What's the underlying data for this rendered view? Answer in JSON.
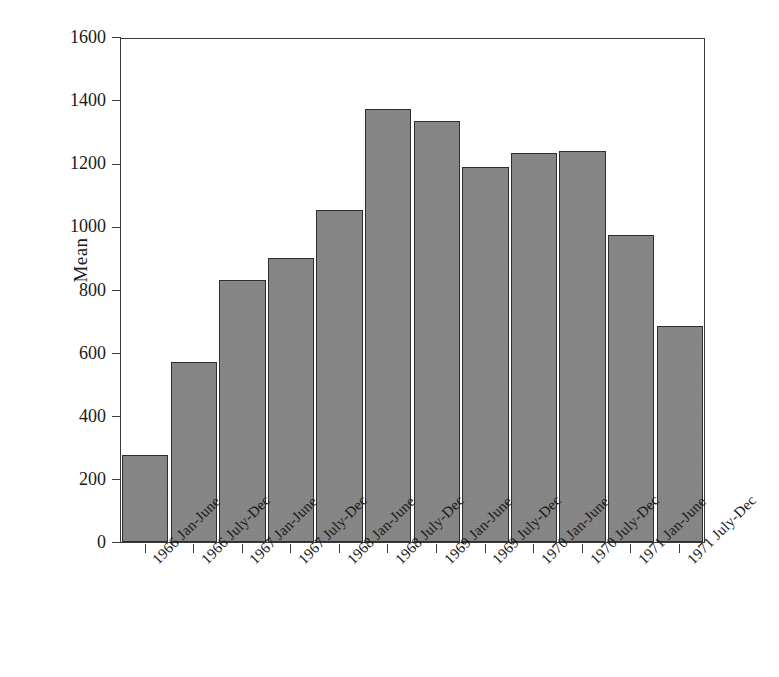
{
  "chart_data": {
    "type": "bar",
    "title": "",
    "subtitle": "",
    "xlabel": "",
    "ylabel": "Mean",
    "ylim": [
      0,
      1600
    ],
    "yticks": [
      0,
      200,
      400,
      600,
      800,
      1000,
      1200,
      1400,
      1600
    ],
    "ytick_labels": [
      "0",
      "200",
      "400",
      "600",
      "800",
      "1000",
      "1200",
      "1400",
      "1600"
    ],
    "grid": false,
    "legend": null,
    "legend_position": "none",
    "bar_color": "#888888",
    "bar_edge_color": "#2e2e2e",
    "background_color": "#ffffff",
    "axis_color": "#3a3a3a",
    "label_rotation_degrees": -45,
    "categories": [
      "1966 Jan-June",
      "1966 July-Dec",
      "1967 Jan-June",
      "1967 July-Dec",
      "1968 Jan-June",
      "1968 July-Dec",
      "1969 Jan-June",
      "1969 July-Dec",
      "1970 Jan-June",
      "1970 July-Dec",
      "1971 Jan-June",
      "1971 July-Dec"
    ],
    "values": [
      277,
      574,
      832,
      904,
      1057,
      1378,
      1340,
      1194,
      1239,
      1245,
      978,
      686
    ]
  }
}
